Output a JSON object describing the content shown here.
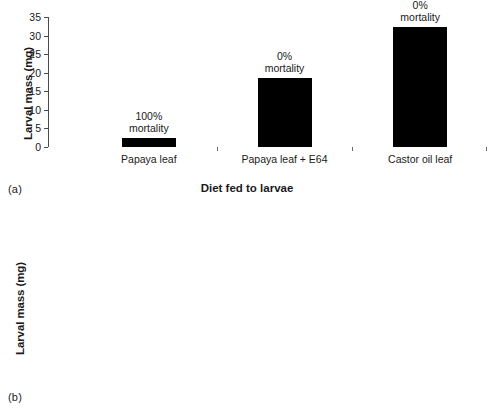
{
  "figure": {
    "panels": [
      {
        "letter": "(a)",
        "ylabel": "Larval mass (mg)",
        "xlabel": "Diet fed to larvae"
      },
      {
        "letter": "(b)",
        "ylabel": "Larval mass (mg)",
        "xlabel": "Diet fed to larvae"
      }
    ]
  },
  "chart_data": [
    {
      "type": "bar",
      "panel": "(a)",
      "title": "",
      "xlabel": "Diet fed to larvae",
      "ylabel": "Larval mass (mg)",
      "ylim": [
        0,
        35
      ],
      "ytick_step": 5,
      "yticks": [
        "35",
        "30",
        "25",
        "20",
        "15",
        "10",
        "5",
        "0"
      ],
      "grid": false,
      "legend": "none",
      "bar_color": "#000000",
      "categories": [
        "Papaya leaf",
        "Papaya leaf + E64",
        "Castor oil leaf"
      ],
      "values": [
        2.4,
        18.5,
        32.4
      ],
      "annotations": [
        {
          "line1": "100%",
          "line2": "mortality"
        },
        {
          "line1": "0%",
          "line2": "mortality"
        },
        {
          "line1": "0%",
          "line2": "mortality"
        }
      ]
    },
    {
      "type": "bar",
      "panel": "(b)",
      "title": "",
      "xlabel": "Diet fed to larvae",
      "ylabel": "Larval mass (mg)",
      "ylim": [
        0,
        14
      ],
      "ytick_step": 2,
      "yticks": [
        "14",
        "12",
        "10",
        "8",
        "6",
        "4",
        "2",
        "0"
      ],
      "grid": false,
      "legend": "none",
      "bar_color": "#000000",
      "categories": [
        "Control",
        "Papain B",
        "Ficin",
        "Bromelain"
      ],
      "values": [
        12.0,
        1.9,
        2.4,
        4.0
      ],
      "annotations": [
        {
          "line1": "0%",
          "line2": "mortality"
        },
        {
          "line1": "80%",
          "line2": "mortality"
        },
        {
          "line1": "80%",
          "line2": "mortality"
        },
        {
          "line1": "45%",
          "line2": "mortality"
        }
      ]
    }
  ]
}
